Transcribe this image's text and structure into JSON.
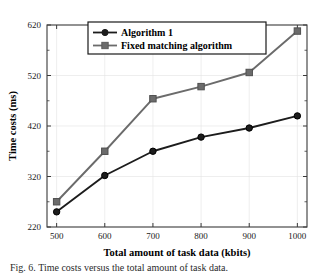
{
  "chart_data": {
    "type": "line",
    "title": "",
    "xlabel": "Total amount of task data (kbits)",
    "ylabel": "Time costs (ms)",
    "x": [
      500,
      600,
      700,
      800,
      900,
      1000
    ],
    "xticklabels": [
      "500",
      "600",
      "700",
      "800",
      "900",
      "1000"
    ],
    "yticks": [
      220,
      320,
      420,
      520,
      620
    ],
    "yticklabels": [
      "220",
      "320",
      "420",
      "520",
      "620"
    ],
    "xlim": [
      480,
      1020
    ],
    "ylim": [
      220,
      620
    ],
    "grid": true,
    "legend_position": "top-center",
    "series": [
      {
        "name": "Algorithm 1",
        "values": [
          250,
          322,
          370,
          398,
          416,
          440
        ],
        "color": "#1c1c1c",
        "marker": "circle"
      },
      {
        "name": "Fixed matching algorithm",
        "values": [
          270,
          370,
          474,
          498,
          526,
          608
        ],
        "color": "#6b6b6b",
        "marker": "square"
      }
    ]
  },
  "legend": {
    "entries": [
      {
        "label": "Algorithm 1"
      },
      {
        "label": "Fixed matching algorithm"
      }
    ]
  },
  "caption": {
    "text": "Fig. 6.  Time costs versus the total amount of task data."
  }
}
